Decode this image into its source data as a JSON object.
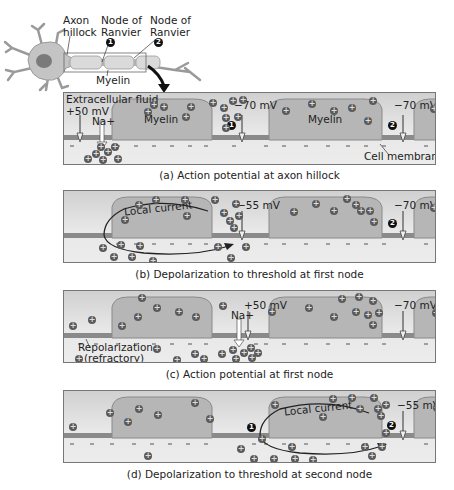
{
  "neuron_diagram": {
    "labels": {
      "axon_hillock": [
        "Axon",
        "hillock"
      ],
      "node1": [
        "Node of",
        "Ranvier"
      ],
      "node2": [
        "Node of",
        "Ranvier"
      ],
      "myelin": "Myelin",
      "badge1": "1",
      "badge2": "2"
    }
  },
  "panels": [
    {
      "id": "a",
      "caption": "(a) Action potential at axon hillock",
      "labels": {
        "fluid": "Extracellular fluid",
        "v_left": "+50 mV",
        "na": "Na+",
        "v_node1": "−70 mV",
        "v_node2": "−70 mV",
        "myelin1": "Myelin",
        "myelin2": "Myelin",
        "membrane": "Cell membrane",
        "badge1": "1",
        "badge2": "2"
      }
    },
    {
      "id": "b",
      "caption": "(b) Depolarization to threshold at first node",
      "labels": {
        "current": "Local current",
        "v_node1": "−55 mV",
        "v_node2": "−70 mV",
        "badge2": "2"
      }
    },
    {
      "id": "c",
      "caption": "(c) Action potential at first node",
      "labels": {
        "v_node1": "+50 mV",
        "na": "Na+",
        "v_node2": "−70 mV",
        "repol1": "Repolarization",
        "repol2": "(refractory)"
      }
    },
    {
      "id": "d",
      "caption": "(d) Depolarization to threshold at second node",
      "labels": {
        "current": "Local current",
        "v_node2": "−55 mV",
        "badge1": "1",
        "badge2": "2"
      }
    }
  ],
  "ion_symbol": "+",
  "colors": {
    "panel_bg_top": "#d0d0d0",
    "panel_bg_bottom": "#ececec",
    "myelin": "#b4b4b4",
    "membrane": "#8a8a8a",
    "ion": "#5a5a5a",
    "neuron_body": "#c8c8c8",
    "nucleus": "#7a7a7a"
  }
}
